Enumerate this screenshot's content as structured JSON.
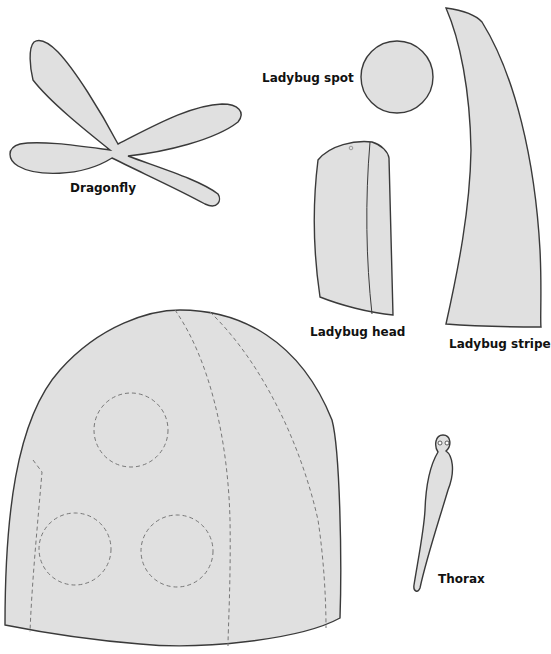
{
  "template": {
    "title": "Ladybug and dragonfly cut-out template",
    "fill_color": "#e0e0e0",
    "outline_color": "#3a3a3a",
    "dashed_guide_color": "#777777"
  },
  "pieces": [
    {
      "id": "dragonfly",
      "label": "Dragonfly",
      "shape": "four-wing dragonfly silhouette"
    },
    {
      "id": "ladybug-spot",
      "label": "Ladybug spot",
      "shape": "circle"
    },
    {
      "id": "ladybug-head",
      "label": "Ladybug head",
      "shape": "curved rectangle with fold line"
    },
    {
      "id": "ladybug-stripe",
      "label": "Ladybug stripe",
      "shape": "tall curved horn strip"
    },
    {
      "id": "ladybug-body",
      "label": "",
      "shape": "dome with dashed spot circles and stripe guides",
      "dashed_circles": 3,
      "dashed_guides": 3
    },
    {
      "id": "thorax",
      "label": "Thorax",
      "shape": "slender body with two eye holes"
    }
  ]
}
